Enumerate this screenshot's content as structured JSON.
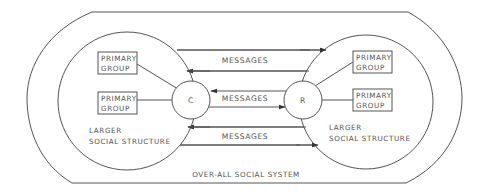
{
  "diagram": {
    "outer_system_label": "OVER-ALL SOCIAL SYSTEM",
    "left": {
      "structure_label_line1": "LARGER",
      "structure_label_line2": "SOCIAL STRUCTURE",
      "node_label": "C",
      "groups": [
        {
          "line1": "PRIMARY",
          "line2": "GROUP"
        },
        {
          "line1": "PRIMARY",
          "line2": "GROUP"
        }
      ]
    },
    "right": {
      "structure_label_line1": "LARGER",
      "structure_label_line2": "SOCIAL STRUCTURE",
      "node_label": "R",
      "groups": [
        {
          "line1": "PRIMARY",
          "line2": "GROUP"
        },
        {
          "line1": "PRIMARY",
          "line2": "GROUP"
        }
      ]
    },
    "channels": [
      {
        "label": "MESSAGES",
        "between": "larger structures (top)"
      },
      {
        "label": "MESSAGES",
        "between": "C and R"
      },
      {
        "label": "MESSAGES",
        "between": "larger structures (bottom)"
      }
    ],
    "colors": {
      "line": "#555555",
      "text": "#555555",
      "background": "#ffffff"
    }
  }
}
